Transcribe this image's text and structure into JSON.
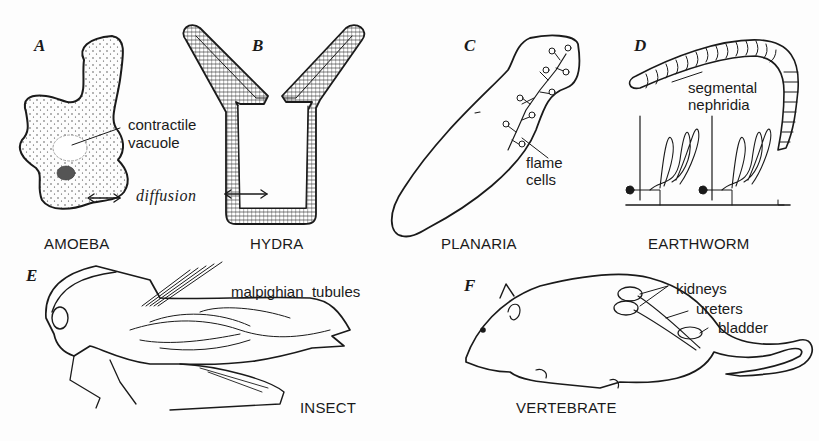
{
  "figure": {
    "panels": [
      {
        "letter": "A",
        "organism": "AMOEBA",
        "annotations": [
          "contractile",
          "vacuole",
          "diffusion"
        ]
      },
      {
        "letter": "B",
        "organism": "HYDRA",
        "annotations": []
      },
      {
        "letter": "C",
        "organism": "PLANARIA",
        "annotations": [
          "flame",
          "cells"
        ]
      },
      {
        "letter": "D",
        "organism": "EARTHWORM",
        "annotations": [
          "segmental",
          "nephridia"
        ]
      },
      {
        "letter": "E",
        "organism": "INSECT",
        "annotations": [
          "malpighian  tubules"
        ]
      },
      {
        "letter": "F",
        "organism": "VERTEBRATE",
        "annotations": [
          "kidneys",
          "ureters",
          "bladder"
        ]
      }
    ],
    "colors": {
      "ink": "#1a1a1a",
      "paper": "#fdfdfd"
    }
  }
}
